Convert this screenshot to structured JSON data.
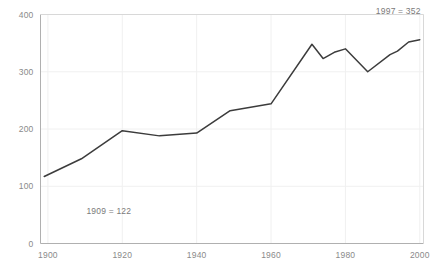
{
  "chart_data": {
    "type": "line",
    "title": "",
    "xlabel": "",
    "ylabel": "",
    "xlim": [
      1898,
      2001
    ],
    "ylim": [
      0,
      400
    ],
    "grid": true,
    "legend": "none",
    "x_ticks": [
      "1900",
      "1920",
      "1940",
      "1960",
      "1980",
      "2000"
    ],
    "x_tick_values": [
      1900,
      1920,
      1940,
      1960,
      1980,
      2000
    ],
    "y_ticks": [
      "0",
      "100",
      "200",
      "300",
      "400"
    ],
    "y_tick_values": [
      0,
      100,
      200,
      300,
      400
    ],
    "series": [
      {
        "name": "series-1",
        "color": "#3c3c3c",
        "x": [
          1899,
          1909,
          1920,
          1930,
          1940,
          1949,
          1960,
          1971,
          1974,
          1977,
          1980,
          1986,
          1992,
          1994,
          1997,
          2000
        ],
        "values": [
          117,
          148,
          197,
          188,
          193,
          232,
          244,
          348,
          323,
          334,
          340,
          300,
          330,
          336,
          352,
          356
        ]
      }
    ],
    "annotations": [
      {
        "name": "annotation-1909",
        "text": "1909 = 122",
        "x": 1909,
        "y": 122,
        "align": "left"
      },
      {
        "name": "annotation-1997",
        "text": "1997 = 352",
        "x": 1997,
        "y": 352,
        "align": "right"
      }
    ],
    "clipped_header_text": ""
  },
  "colors": {
    "line": "#3c3c3c",
    "grid": "#f0f0f0",
    "axis": "#b5b5b5",
    "tick_text": "#8a8a8a",
    "annotation_text": "#7a7a7a",
    "background": "#ffffff"
  }
}
